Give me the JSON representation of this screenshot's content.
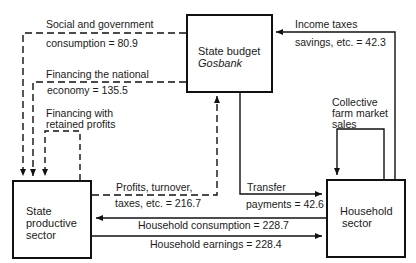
{
  "nodes": {
    "state_budget": {
      "line1": "State budget",
      "line2": "Gosbank"
    },
    "state_productive": {
      "line1": "State",
      "line2": "productive",
      "line3": "sector"
    },
    "household": {
      "line1": "Household",
      "line2": "sector"
    }
  },
  "flows": {
    "social_consumption": {
      "line1": "Social and government",
      "line2": "consumption = 80.9",
      "style": "dashed"
    },
    "financing_national": {
      "line1": "Financing the national",
      "line2": "economy = 135.5",
      "style": "dashed"
    },
    "retained_profits": {
      "line1": "Financing with",
      "line2": "retained profits",
      "style": "dashed"
    },
    "profits_turnover": {
      "line1": "Profits, turnover,",
      "line2": "taxes, etc. = 216.7",
      "style": "dashed"
    },
    "income_taxes": {
      "line1": "Income taxes",
      "line2": "savings, etc. = 42.3",
      "style": "solid"
    },
    "collective_farm": {
      "line1": "Collective",
      "line2": "farm market",
      "line3": "sales",
      "style": "solid"
    },
    "transfer": {
      "line1": "Transfer",
      "line2": "payments = 42.6",
      "style": "solid"
    },
    "household_consumption": {
      "label": "Household consumption = 228.7",
      "style": "solid"
    },
    "household_earnings": {
      "label": "Household earnings = 228.4",
      "style": "solid"
    }
  },
  "colors": {
    "line": "#111111",
    "background": "#ffffff"
  }
}
